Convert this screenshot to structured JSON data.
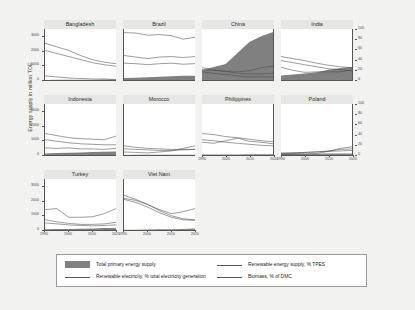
{
  "chart_data": {
    "type": "line",
    "title": "",
    "ylabel": "Energy supply in million TOE",
    "xlabel": "",
    "grid": false,
    "legend_position": "bottom",
    "layout": {
      "rows": 3,
      "cols": 4
    },
    "x": [
      1990,
      1995,
      2000,
      2005,
      2010,
      2015,
      2020
    ],
    "xlim": [
      1990,
      2020
    ],
    "xticks": [
      "1990",
      "1995",
      "2000",
      "2005",
      "2010",
      "2015",
      "2020"
    ],
    "left_axis": {
      "label": "Energy supply in million TOE",
      "ticks": [
        "0",
        "1000",
        "2000",
        "3000"
      ],
      "lim": [
        0,
        3500
      ]
    },
    "right_axis": {
      "label": "",
      "ticks": [
        "0",
        "20",
        "40",
        "60",
        "80",
        "100"
      ],
      "lim": [
        0,
        100
      ]
    },
    "series_names": [
      "Total primary energy supply",
      "Renewable energy supply, % TPES",
      "Renewable electricity, % total electricity generation",
      "Biomass, % of DMC"
    ],
    "panels": [
      {
        "name": "Bangladesh",
        "tpes": [
          8,
          11,
          14,
          18,
          24,
          31,
          38
        ],
        "renew_supply_pct": [
          72,
          65,
          58,
          48,
          40,
          35,
          32
        ],
        "renew_elec_pct": [
          8,
          6,
          4,
          3,
          2,
          2,
          1
        ],
        "biomass_pct": [
          58,
          52,
          46,
          40,
          34,
          30,
          27
        ]
      },
      {
        "name": "Brazil",
        "tpes": [
          140,
          160,
          185,
          215,
          265,
          295,
          290
        ],
        "renew_supply_pct": [
          48,
          45,
          42,
          45,
          46,
          44,
          46
        ],
        "renew_elec_pct": [
          93,
          92,
          88,
          89,
          87,
          80,
          84
        ],
        "biomass_pct": [
          33,
          32,
          30,
          32,
          33,
          31,
          32
        ]
      },
      {
        "name": "China",
        "tpes": [
          680,
          900,
          1100,
          1850,
          2600,
          3000,
          3300
        ],
        "renew_supply_pct": [
          24,
          20,
          17,
          13,
          12,
          12,
          13
        ],
        "renew_elec_pct": [
          20,
          19,
          17,
          16,
          18,
          24,
          27
        ],
        "biomass_pct": [
          16,
          13,
          11,
          8,
          6,
          6,
          6
        ]
      },
      {
        "name": "India",
        "tpes": [
          305,
          370,
          440,
          530,
          700,
          830,
          900
        ],
        "renew_supply_pct": [
          46,
          42,
          38,
          33,
          29,
          26,
          24
        ],
        "renew_elec_pct": [
          25,
          19,
          15,
          16,
          16,
          16,
          20
        ],
        "biomass_pct": [
          38,
          34,
          30,
          26,
          22,
          20,
          18
        ]
      },
      {
        "name": "Indonesia",
        "tpes": [
          100,
          130,
          155,
          175,
          205,
          230,
          245
        ],
        "renew_supply_pct": [
          42,
          38,
          34,
          32,
          31,
          30,
          37
        ],
        "renew_elec_pct": [
          14,
          13,
          14,
          12,
          12,
          11,
          13
        ],
        "biomass_pct": [
          30,
          27,
          24,
          22,
          21,
          20,
          20
        ]
      },
      {
        "name": "Morocco",
        "tpes": [
          7,
          9,
          10,
          13,
          17,
          19,
          21
        ],
        "renew_supply_pct": [
          18,
          15,
          13,
          12,
          11,
          11,
          11
        ],
        "renew_elec_pct": [
          6,
          5,
          4,
          6,
          8,
          13,
          18
        ],
        "biomass_pct": [
          12,
          11,
          10,
          9,
          9,
          10,
          11
        ]
      },
      {
        "name": "Philippines",
        "tpes": [
          28,
          35,
          40,
          42,
          43,
          50,
          56
        ],
        "renew_supply_pct": [
          42,
          40,
          36,
          34,
          31,
          28,
          26
        ],
        "renew_elec_pct": [
          25,
          23,
          28,
          33,
          27,
          25,
          22
        ],
        "biomass_pct": [
          30,
          28,
          25,
          23,
          21,
          19,
          18
        ]
      },
      {
        "name": "Poland",
        "tpes": [
          100,
          98,
          90,
          93,
          100,
          98,
          102
        ],
        "renew_supply_pct": [
          3,
          4,
          5,
          6,
          8,
          11,
          12
        ],
        "renew_elec_pct": [
          1,
          2,
          2,
          3,
          7,
          13,
          16
        ],
        "biomass_pct": [
          4,
          4,
          5,
          6,
          7,
          8,
          9
        ]
      },
      {
        "name": "Turkey",
        "tpes": [
          52,
          63,
          77,
          86,
          105,
          130,
          145
        ],
        "renew_supply_pct": [
          20,
          16,
          13,
          11,
          11,
          12,
          15
        ],
        "renew_elec_pct": [
          40,
          42,
          25,
          25,
          26,
          32,
          42
        ],
        "biomass_pct": [
          14,
          12,
          10,
          9,
          8,
          9,
          10
        ]
      },
      {
        "name": "Viet Nam",
        "tpes": [
          18,
          24,
          32,
          44,
          60,
          72,
          95
        ],
        "renew_supply_pct": [
          68,
          60,
          50,
          38,
          28,
          22,
          20
        ],
        "renew_elec_pct": [
          62,
          58,
          50,
          40,
          32,
          36,
          42
        ],
        "biomass_pct": [
          60,
          54,
          45,
          34,
          25,
          20,
          19
        ]
      }
    ]
  },
  "legend": {
    "items": [
      {
        "label": "Total primary energy supply",
        "style": "area",
        "color": "#808080"
      },
      {
        "label": "Renewable electricity, % total electricity generation",
        "style": "line",
        "color": "#555555"
      },
      {
        "label": "Renewable energy supply, % TPES",
        "style": "line",
        "color": "#555555"
      },
      {
        "label": "Biomass, % of DMC",
        "style": "line",
        "color": "#555555"
      }
    ]
  }
}
